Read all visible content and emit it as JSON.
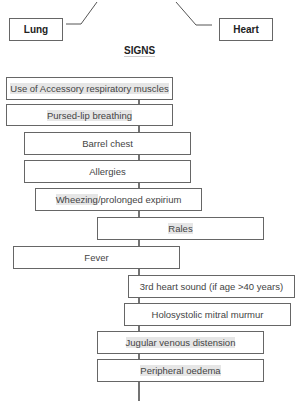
{
  "top_nodes": {
    "lung": "Lung",
    "heart": "Heart"
  },
  "section_title": "SIGNS",
  "signs": [
    {
      "label": "Use of Accessory respiratory muscles",
      "highlight": "Use of Accessory respiratory muscles",
      "rest": ""
    },
    {
      "label": "Pursed-lip breathing",
      "highlight": "Pursed-lip breathing",
      "rest": ""
    },
    {
      "label": "Barrel chest",
      "highlight": "",
      "rest": "Barrel chest"
    },
    {
      "label": "Allergies",
      "highlight": "",
      "rest": "Allergies"
    },
    {
      "label": "Wheezing/prolonged expirium",
      "highlight": "Wheezing",
      "rest": "/prolonged expirium"
    },
    {
      "label": "Rales",
      "highlight": "Rales",
      "rest": ""
    },
    {
      "label": "Fever",
      "highlight": "",
      "rest": "Fever"
    },
    {
      "label": "3rd heart sound (if age >40 years)",
      "highlight": "",
      "rest": "3rd heart sound (if age >40 years)"
    },
    {
      "label": "Holosystolic mitral murmur",
      "highlight": "",
      "rest": "Holosystolic mitral murmur"
    },
    {
      "label": "Jugular venous distension",
      "highlight": "Jugular venous distension",
      "rest": ""
    },
    {
      "label": "Peripheral oedema",
      "highlight": "Peripheral oedema",
      "rest": ""
    }
  ]
}
